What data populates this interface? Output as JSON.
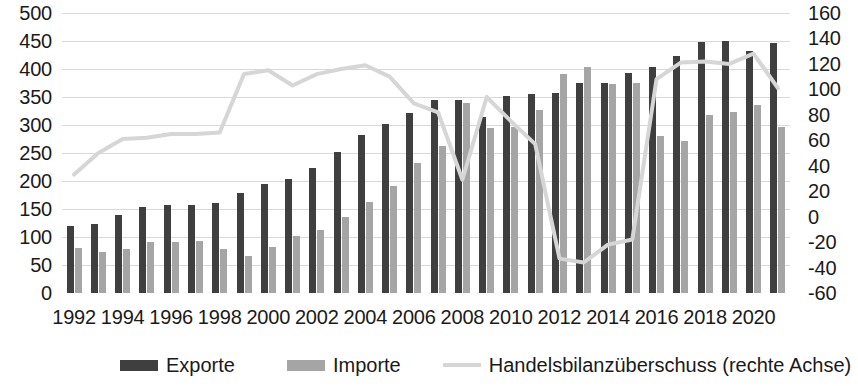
{
  "chart_data": {
    "type": "bar",
    "title": "",
    "subtitle": "",
    "xlabel": "",
    "ylabel": "",
    "grid": true,
    "legend_position": "bottom",
    "x": [
      1992,
      1993,
      1994,
      1995,
      1996,
      1997,
      1998,
      1999,
      2000,
      2001,
      2002,
      2003,
      2004,
      2005,
      2006,
      2007,
      2008,
      2009,
      2010,
      2011,
      2012,
      2013,
      2014,
      2015,
      2016,
      2017,
      2018,
      2019,
      2020,
      2021
    ],
    "categories": [
      "1992",
      "1993",
      "1994",
      "1995",
      "1996",
      "1997",
      "1998",
      "1999",
      "2000",
      "2001",
      "2002",
      "2003",
      "2004",
      "2005",
      "2006",
      "2007",
      "2008",
      "2009",
      "2010",
      "2011",
      "2012",
      "2013",
      "2014",
      "2015",
      "2016",
      "2017",
      "2018",
      "2019",
      "2020",
      "2021"
    ],
    "xtick_labels": [
      "1992",
      "1994",
      "1996",
      "1998",
      "2000",
      "2002",
      "2004",
      "2006",
      "2008",
      "2010",
      "2012",
      "2014",
      "2016",
      "2018",
      "2020"
    ],
    "xtick_years": [
      1992,
      1994,
      1996,
      1998,
      2000,
      2002,
      2004,
      2006,
      2008,
      2010,
      2012,
      2014,
      2016,
      2018,
      2020
    ],
    "ylim": [
      0,
      500
    ],
    "ytick_labels": [
      "500",
      "450",
      "400",
      "350",
      "300",
      "250",
      "200",
      "150",
      "100",
      "50",
      "0"
    ],
    "ytick_values": [
      500,
      450,
      400,
      350,
      300,
      250,
      200,
      150,
      100,
      50,
      0
    ],
    "y2lim": [
      -60,
      160
    ],
    "y2tick_labels": [
      "160",
      "140",
      "120",
      "100",
      "80",
      "60",
      "40",
      "20",
      "0",
      "-20",
      "-40",
      "-60"
    ],
    "y2tick_values": [
      160,
      140,
      120,
      100,
      80,
      60,
      40,
      20,
      0,
      -20,
      -40,
      -60
    ],
    "series": [
      {
        "name": "Exporte",
        "type": "bar",
        "axis": "left",
        "color": "#3f3f3f",
        "values": [
          120,
          123,
          139,
          153,
          157,
          158,
          161,
          178,
          195,
          204,
          224,
          251,
          282,
          301,
          322,
          344,
          345,
          315,
          352,
          355,
          358,
          375,
          375,
          393,
          403,
          423,
          448,
          450,
          433,
          447
        ]
      },
      {
        "name": "Importe",
        "type": "bar",
        "axis": "left",
        "color": "#a5a5a5",
        "values": [
          81,
          73,
          78,
          91,
          92,
          93,
          79,
          67,
          83,
          101,
          112,
          135,
          163,
          191,
          233,
          262,
          339,
          294,
          297,
          327,
          391,
          404,
          373,
          375,
          280,
          271,
          318,
          323,
          336,
          297
        ]
      },
      {
        "name": "Handelsbilanzüberschuss (rechte Achse)",
        "type": "line",
        "axis": "right",
        "color": "#d6d6d6",
        "values": [
          33,
          50,
          61,
          62,
          65,
          65,
          66,
          112,
          115,
          103,
          112,
          116,
          119,
          110,
          89,
          82,
          29,
          94,
          75,
          57,
          -33,
          -36,
          -22,
          -18,
          108,
          121,
          122,
          120,
          128,
          101
        ]
      }
    ]
  },
  "legend": {
    "items": [
      {
        "label": "Exporte",
        "marker": "bar-dark",
        "color": "#3f3f3f"
      },
      {
        "label": "Importe",
        "marker": "bar-light",
        "color": "#a5a5a5"
      },
      {
        "label": "Handelsbilanzüberschuss (rechte Achse)",
        "marker": "line",
        "color": "#d6d6d6"
      }
    ]
  }
}
